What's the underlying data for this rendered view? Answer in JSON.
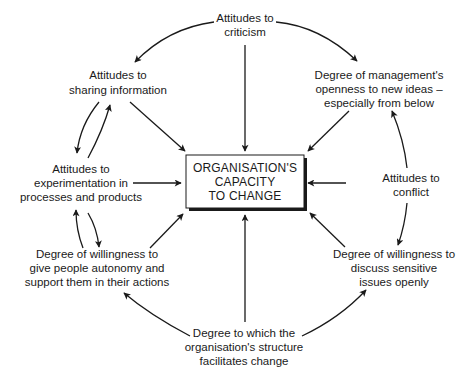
{
  "diagram": {
    "center": {
      "lines": [
        "ORGANISATION'S",
        "CAPACITY",
        "TO CHANGE"
      ]
    },
    "nodes": {
      "criticism": {
        "lines": [
          "Attitudes to",
          "criticism"
        ]
      },
      "sharing": {
        "lines": [
          "Attitudes to",
          "sharing information"
        ]
      },
      "management": {
        "lines": [
          "Degree of management's",
          "openness to new ideas –",
          "especially from below"
        ]
      },
      "experimentation": {
        "lines": [
          "Attitudes to",
          "experimentation in",
          "processes and products"
        ]
      },
      "conflict": {
        "lines": [
          "Attitudes to",
          "conflict"
        ]
      },
      "autonomy": {
        "lines": [
          "Degree of willingness to",
          "give people autonomy and",
          "support them in their actions"
        ]
      },
      "sensitive": {
        "lines": [
          "Degree of willingness to",
          "discuss sensitive",
          "issues openly"
        ]
      },
      "structure": {
        "lines": [
          "Degree to which the",
          "organisation's structure",
          "facilitates change"
        ]
      }
    },
    "edges": [
      {
        "from": "criticism",
        "to": "center"
      },
      {
        "from": "sharing",
        "to": "center"
      },
      {
        "from": "management",
        "to": "center"
      },
      {
        "from": "experimentation",
        "to": "center"
      },
      {
        "from": "conflict",
        "to": "center"
      },
      {
        "from": "autonomy",
        "to": "center"
      },
      {
        "from": "sensitive",
        "to": "center"
      },
      {
        "from": "structure",
        "to": "center"
      },
      {
        "from": "criticism",
        "to": "sharing"
      },
      {
        "from": "criticism",
        "to": "management"
      },
      {
        "from": "sharing",
        "to": "experimentation"
      },
      {
        "from": "experimentation",
        "to": "sharing"
      },
      {
        "from": "experimentation",
        "to": "autonomy"
      },
      {
        "from": "autonomy",
        "to": "experimentation"
      },
      {
        "from": "conflict",
        "to": "management"
      },
      {
        "from": "conflict",
        "to": "sensitive"
      },
      {
        "from": "structure",
        "to": "autonomy"
      },
      {
        "from": "structure",
        "to": "sensitive"
      }
    ]
  }
}
